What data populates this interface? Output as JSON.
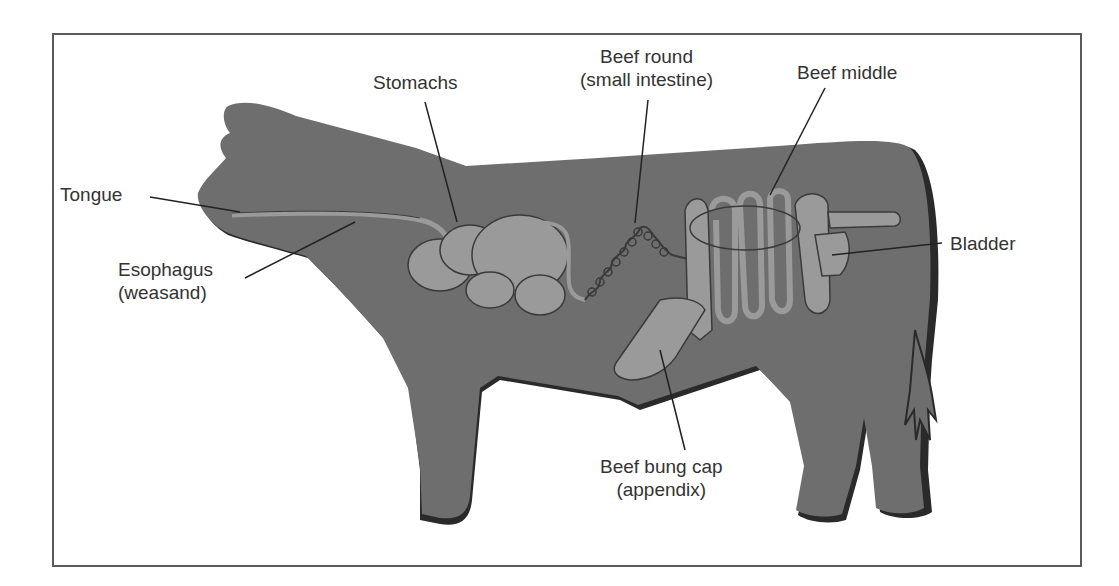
{
  "diagram": {
    "colors": {
      "body": "#6e6e6e",
      "body_shadow": "#2a2a2a",
      "organ": "#9a9a9a",
      "organ_outline": "#3a3a3a",
      "frame": "#5a5a5a",
      "leader": "#222222",
      "text": "#333333"
    },
    "labels": {
      "tongue": "Tongue",
      "esophagus_line1": "Esophagus",
      "esophagus_line2": "(weasand)",
      "stomachs": "Stomachs",
      "beef_round_line1": "Beef round",
      "beef_round_line2": "(small intestine)",
      "beef_middle": "Beef middle",
      "bladder": "Bladder",
      "bung_cap_line1": "Beef bung cap",
      "bung_cap_line2": "(appendix)"
    }
  }
}
